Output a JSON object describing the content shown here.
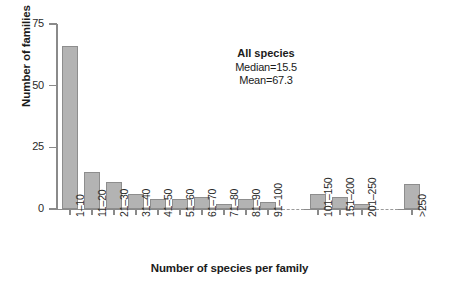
{
  "chart_data": {
    "type": "bar",
    "title": "",
    "xlabel": "Number of species per family",
    "ylabel": "Number of families",
    "ylim": [
      0,
      75
    ],
    "yticks": [
      0,
      25,
      50,
      75
    ],
    "grid": false,
    "legend": null,
    "categories": [
      "1–10",
      "11–20",
      "21–30",
      "31–40",
      "41–50",
      "51–60",
      "61–70",
      "71–80",
      "81–90",
      "91–100",
      "101–150",
      "151–200",
      "201–250",
      ">250"
    ],
    "values": [
      66,
      15,
      11,
      6,
      4,
      4,
      5,
      2,
      4,
      3,
      6,
      5,
      2,
      10
    ],
    "axis_breaks": [
      {
        "after_category": "91–100",
        "before_category": "101–150"
      },
      {
        "after_category": "201–250",
        "before_category": ">250"
      }
    ],
    "annotations": [
      {
        "name": "all-species",
        "title": "All species",
        "lines": [
          "Median=15.5",
          "Mean=67.3"
        ]
      }
    ],
    "colors": {
      "bar_fill": "#b3b3b3",
      "bar_border": "#8d8d8d",
      "axis": "#8a8a8a",
      "text": "#1b1b1b"
    }
  },
  "annotation": {
    "title": "All species",
    "median": "Median=15.5",
    "mean": "Mean=67.3"
  },
  "axes": {
    "y_title": "Number of families",
    "x_title": "Number of species per family",
    "y_tick_labels": [
      "75",
      "50",
      "25",
      "0"
    ]
  }
}
